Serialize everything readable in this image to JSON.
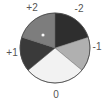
{
  "chart_data": {
    "type": "pie",
    "title": "",
    "start_angle_deg": 0,
    "direction": "clockwise",
    "categories": [
      "-2",
      "-1",
      "0",
      "+1",
      "+2"
    ],
    "values": [
      20,
      16,
      28,
      16,
      20
    ],
    "colors": [
      "#2e2e2e",
      "#b0b0b0",
      "#f2f2f2",
      "#3a3a3a",
      "#7d7d7d"
    ],
    "labels": [
      {
        "text": "-2",
        "x": 79,
        "y": 12
      },
      {
        "text": "-1",
        "x": 97,
        "y": 50
      },
      {
        "text": "0",
        "x": 56,
        "y": 98
      },
      {
        "text": "+1",
        "x": 12,
        "y": 56
      },
      {
        "text": "+2",
        "x": 32,
        "y": 11
      }
    ],
    "marker": {
      "x": 43,
      "y": 35,
      "color": "#ffffff",
      "description": "small white dot in +2 slice"
    },
    "legend": "none",
    "grid": false
  },
  "geometry": {
    "cx": 55,
    "cy": 48,
    "r": 35
  }
}
